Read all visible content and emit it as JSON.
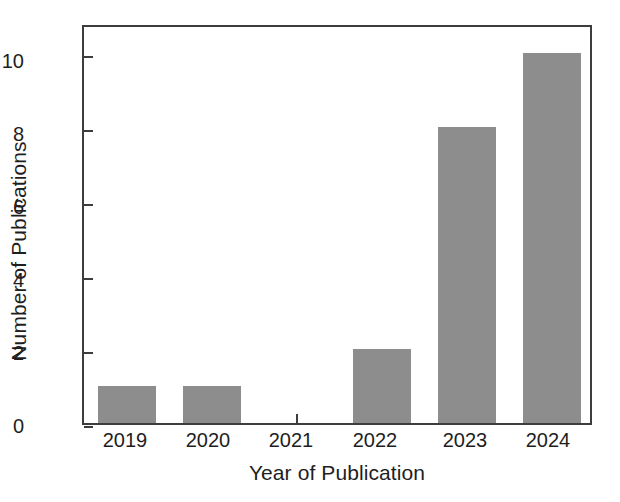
{
  "chart_data": {
    "type": "bar",
    "title": "",
    "xlabel": "Year of Publication",
    "ylabel": "Number of Publications",
    "categories": [
      "2019",
      "2020",
      "2021",
      "2022",
      "2023",
      "2024"
    ],
    "values": [
      1,
      1,
      0,
      2,
      8,
      10
    ],
    "series": [
      {
        "name": "Number of Publications",
        "values": [
          1,
          1,
          0,
          2,
          8,
          10
        ]
      }
    ],
    "yticks": [
      "0",
      "2",
      "4",
      "6",
      "8",
      "10"
    ],
    "ytick_values": [
      0,
      2,
      4,
      6,
      8,
      10
    ],
    "xticks": [
      "2019",
      "2020",
      "2021",
      "2022",
      "2023",
      "2024"
    ],
    "ylim": [
      0,
      10.8
    ],
    "grid": false,
    "legend": false,
    "legend_position": "none",
    "bar_color": "#8d8d8d",
    "axis_color": "#3d3d3d",
    "background_color": "#ffffff",
    "text_color": "#1e1e1e"
  }
}
